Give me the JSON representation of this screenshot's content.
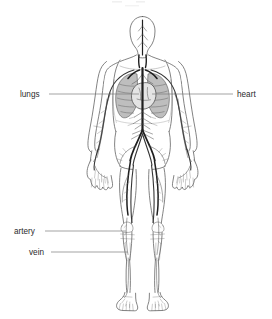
{
  "figure": {
    "background_color": "#ffffff",
    "width": 272,
    "height": 319,
    "partial_caption_top": "",
    "labels": [
      {
        "id": "lungs",
        "text": "lungs",
        "side": "left",
        "text_x": 20,
        "text_y": 97,
        "leader_x1": 49,
        "leader_y1": 94,
        "leader_x2": 139,
        "leader_y2": 94
      },
      {
        "id": "heart",
        "text": "heart",
        "side": "right",
        "text_x": 237,
        "text_y": 97,
        "leader_x1": 152,
        "leader_y1": 94,
        "leader_x2": 233,
        "leader_y2": 94
      },
      {
        "id": "artery",
        "text": "artery",
        "side": "left",
        "text_x": 14,
        "text_y": 234,
        "leader_x1": 45,
        "leader_y1": 231,
        "leader_x2": 126,
        "leader_y2": 231
      },
      {
        "id": "vein",
        "text": "vein",
        "side": "left",
        "text_x": 29,
        "text_y": 255,
        "leader_x1": 51,
        "leader_y1": 252,
        "leader_x2": 128,
        "leader_y2": 252
      }
    ],
    "colors": {
      "label_text": "#2b2b2b",
      "leader_line": "#7d7d7d",
      "body_outline": "#5a5a5a",
      "lung_fill": "#b9b9b9",
      "heart_fill": "#e4e4e4",
      "vessel_dark": "#1f1f1f",
      "vessel_light": "#6b6b6b",
      "background": "#ffffff"
    },
    "anatomy_parts": [
      "head",
      "neck",
      "shoulders",
      "thorax",
      "lungs",
      "heart",
      "aorta",
      "arms",
      "hands",
      "abdomen",
      "pelvis",
      "legs",
      "knees",
      "feet"
    ]
  }
}
